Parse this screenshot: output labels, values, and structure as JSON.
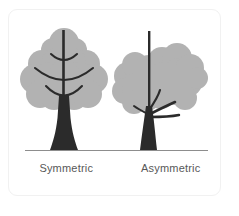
{
  "figure": {
    "card": {
      "background": "#ffffff",
      "border_color": "#f1f1f1"
    },
    "ground_line": {
      "color": "#8d8d8d"
    },
    "palette": {
      "canopy": "#b2b2b2",
      "canopy_shade": "#a8a8a8",
      "trunk": "#2b2b2b",
      "branch_arc": "#2b2b2b",
      "label_text": "#585858"
    },
    "items": [
      {
        "label": "Symmetric",
        "name": "symmetric-tree",
        "canopy_style": "scalloped-tiered",
        "trunk_style": "straight-central",
        "arc_count": 3
      },
      {
        "label": "Asymmetric",
        "name": "asymmetric-tree",
        "canopy_style": "cloud-blob-cluster",
        "trunk_style": "curved-leaning",
        "branch_direction": "right"
      }
    ]
  }
}
